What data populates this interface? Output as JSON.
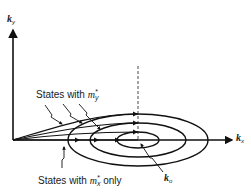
{
  "diagram": {
    "axes": {
      "y_label": "k",
      "y_label_sub": "y",
      "x_label": "k",
      "x_label_sub": "x"
    },
    "labels": {
      "states_my": "States with ",
      "states_my_symbol": "m",
      "states_my_sup": "*",
      "states_my_sub": "y",
      "states_mx": "States with ",
      "states_mx_symbol": "m",
      "states_mx_sup": "*",
      "states_mx_sub": "x",
      "states_mx_suffix": " only",
      "k0": "k",
      "k0_sub": "o"
    },
    "ellipses": [
      {
        "name": "outer",
        "cx": 138,
        "cy": 140,
        "rx": 70,
        "ry": 26
      },
      {
        "name": "middle",
        "cx": 138,
        "cy": 140,
        "rx": 48,
        "ry": 17
      },
      {
        "name": "inner",
        "cx": 138,
        "cy": 140,
        "rx": 21,
        "ry": 8
      }
    ],
    "colors": {
      "line": "#111111",
      "text": "#1a1a1a",
      "background": "#ffffff"
    }
  }
}
